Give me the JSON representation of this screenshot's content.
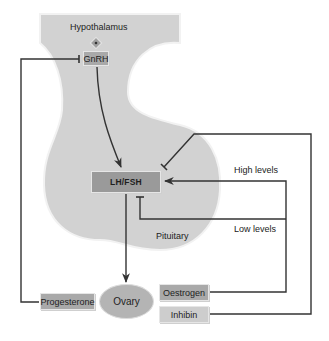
{
  "diagram": {
    "regions": {
      "hypothalamus": "Hypothalamus",
      "pituitary": "Pituitary"
    },
    "nodes": {
      "gnrh": "GnRH",
      "lhfsh": "LH/FSH",
      "ovary": "Ovary",
      "progesterone": "Progesterone",
      "oestrogen": "Oestrogen",
      "inhibin": "Inhibin"
    },
    "feedback_labels": {
      "high": "High levels",
      "low": "Low levels"
    },
    "edges": [
      {
        "from": "GnRH",
        "to": "LH/FSH",
        "type": "stimulate"
      },
      {
        "from": "LH/FSH",
        "to": "Ovary",
        "type": "stimulate"
      },
      {
        "from": "Progesterone",
        "to": "GnRH",
        "type": "inhibit"
      },
      {
        "from": "Oestrogen",
        "to": "LH/FSH",
        "type": "stimulate",
        "condition": "High levels"
      },
      {
        "from": "Oestrogen",
        "to": "LH/FSH",
        "type": "inhibit",
        "condition": "Low levels"
      },
      {
        "from": "Inhibin",
        "to": "LH/FSH",
        "type": "inhibit"
      }
    ],
    "colors": {
      "region_fill": "#d2d2d2",
      "box_fill": "#a9a9a9",
      "line": "#333333"
    }
  }
}
